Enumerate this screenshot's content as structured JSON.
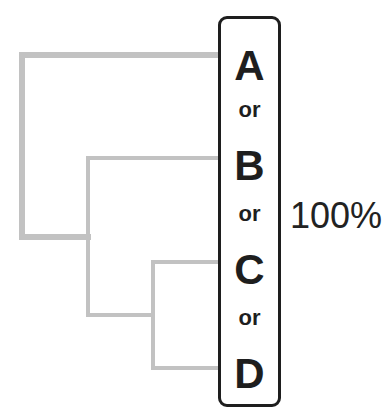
{
  "diagram": {
    "leaves": [
      "A",
      "B",
      "C",
      "D"
    ],
    "separator": "or",
    "percentage": "100%",
    "colors": {
      "branch": "#c0c0c0",
      "box_border": "#1e1e1e",
      "text": "#1e1e1e"
    }
  }
}
